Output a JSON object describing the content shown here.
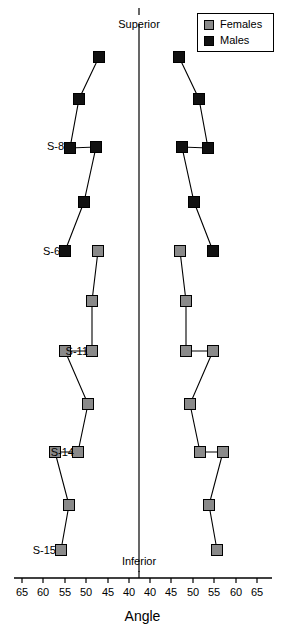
{
  "chart_data": {
    "type": "line",
    "title": "",
    "xlabel": "Angle",
    "ylabel": "",
    "orientation": "mirrored-butterfly",
    "center_axis_value": 0,
    "pole_labels": {
      "top": "Superior",
      "bottom": "Inferior"
    },
    "x_axis": {
      "left_ticks": [
        65,
        60,
        55,
        50,
        45,
        40
      ],
      "right_ticks": [
        40,
        45,
        50,
        55,
        60,
        65
      ],
      "left_tick_px": [
        22,
        43,
        65,
        86,
        108,
        129
      ],
      "right_tick_px": [
        150,
        171,
        193,
        214,
        236,
        257
      ],
      "center_tick_px": 139,
      "axis_y_px": 578,
      "axis_x_start_px": 14,
      "axis_x_end_px": 272
    },
    "y_axis": {
      "site_labels": [
        "S-8",
        "S-6",
        "S-11",
        "S-14",
        "S-15"
      ],
      "site_label_y_px": [
        146,
        251,
        351,
        452,
        550
      ]
    },
    "legend": {
      "position": "top-right",
      "entries": [
        {
          "label": "Females",
          "color": "#8a8a8a",
          "marker": "square"
        },
        {
          "label": "Males",
          "color": "#111111",
          "marker": "square"
        }
      ]
    },
    "colors": {
      "males": "#111111",
      "females": "#8a8a8a",
      "axis": "#000000",
      "connector": "#000000",
      "background": "#ffffff"
    },
    "series": [
      {
        "name": "Males",
        "side": "left",
        "color": "#111111",
        "points": [
          {
            "x_px": 99,
            "y_px": 57,
            "angle": 41.5
          },
          {
            "x_px": 79,
            "y_px": 99,
            "angle": 46.2
          },
          {
            "x_px": 70,
            "y_px": 148,
            "angle": 48.3
          },
          {
            "x_px": 96,
            "y_px": 147,
            "angle": 42.2
          },
          {
            "x_px": 84,
            "y_px": 202,
            "angle": 45.0
          },
          {
            "x_px": 65,
            "y_px": 251,
            "angle": 49.4
          }
        ]
      },
      {
        "name": "Males",
        "side": "right",
        "color": "#111111",
        "points": [
          {
            "x_px": 179,
            "y_px": 57,
            "angle": 41.5
          },
          {
            "x_px": 199,
            "y_px": 99,
            "angle": 46.2
          },
          {
            "x_px": 208,
            "y_px": 148,
            "angle": 48.3
          },
          {
            "x_px": 182,
            "y_px": 147,
            "angle": 42.2
          },
          {
            "x_px": 194,
            "y_px": 202,
            "angle": 45.0
          },
          {
            "x_px": 213,
            "y_px": 251,
            "angle": 49.4
          }
        ]
      },
      {
        "name": "Females",
        "side": "left",
        "color": "#8a8a8a",
        "points": [
          {
            "x_px": 98,
            "y_px": 251,
            "angle": 42.0
          },
          {
            "x_px": 92,
            "y_px": 301,
            "angle": 43.4
          },
          {
            "x_px": 92,
            "y_px": 351,
            "angle": 43.4
          },
          {
            "x_px": 65,
            "y_px": 351,
            "angle": 49.4
          },
          {
            "x_px": 88,
            "y_px": 404,
            "angle": 44.3
          },
          {
            "x_px": 78,
            "y_px": 452,
            "angle": 46.5
          },
          {
            "x_px": 55,
            "y_px": 452,
            "angle": 51.7
          },
          {
            "x_px": 69,
            "y_px": 505,
            "angle": 48.5
          },
          {
            "x_px": 61,
            "y_px": 550,
            "angle": 50.4
          }
        ]
      },
      {
        "name": "Females",
        "side": "right",
        "color": "#8a8a8a",
        "points": [
          {
            "x_px": 180,
            "y_px": 251,
            "angle": 42.0
          },
          {
            "x_px": 186,
            "y_px": 301,
            "angle": 43.4
          },
          {
            "x_px": 186,
            "y_px": 351,
            "angle": 43.4
          },
          {
            "x_px": 213,
            "y_px": 351,
            "angle": 49.4
          },
          {
            "x_px": 190,
            "y_px": 404,
            "angle": 44.3
          },
          {
            "x_px": 200,
            "y_px": 452,
            "angle": 46.5
          },
          {
            "x_px": 223,
            "y_px": 452,
            "angle": 51.7
          },
          {
            "x_px": 209,
            "y_px": 505,
            "angle": 48.5
          },
          {
            "x_px": 217,
            "y_px": 550,
            "angle": 50.4
          }
        ]
      }
    ]
  },
  "axis_title": "Angle",
  "pole_top": "Superior",
  "pole_bottom": "Inferior"
}
